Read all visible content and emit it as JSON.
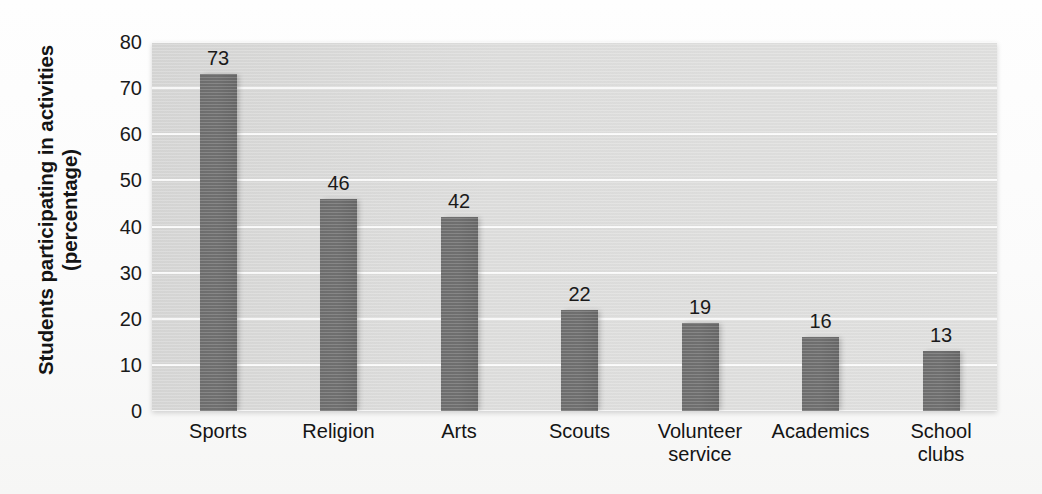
{
  "chart_data": {
    "type": "bar",
    "title": "",
    "xlabel": "",
    "ylabel": "Students participating in activities (percentage)",
    "ylabel_lines": [
      "Students participating in activities",
      "(percentage)"
    ],
    "categories": [
      "Sports",
      "Religion",
      "Arts",
      "Scouts",
      "Volunteer service",
      "Academics",
      "School clubs"
    ],
    "category_lines": [
      [
        "Sports"
      ],
      [
        "Religion"
      ],
      [
        "Arts"
      ],
      [
        "Scouts"
      ],
      [
        "Volunteer",
        "service"
      ],
      [
        "Academics"
      ],
      [
        "School",
        "clubs"
      ]
    ],
    "values": [
      73,
      46,
      42,
      22,
      19,
      16,
      13
    ],
    "value_labels": [
      "73",
      "46",
      "42",
      "22",
      "19",
      "16",
      "13"
    ],
    "ylim": [
      0,
      80
    ],
    "ytick_values": [
      0,
      10,
      20,
      30,
      40,
      50,
      60,
      70,
      80
    ],
    "ytick_labels": [
      "0",
      "10",
      "20",
      "30",
      "40",
      "50",
      "60",
      "70",
      "80"
    ],
    "grid": true,
    "grid_orientation": "horizontal",
    "legend": false,
    "legend_position": "none",
    "colors": {
      "bar": "#6e6e6e",
      "plot_background": "#dddddc",
      "gridline": "#fdfdfd",
      "figure_background": "#fbfbfb",
      "text": "#141414"
    }
  }
}
